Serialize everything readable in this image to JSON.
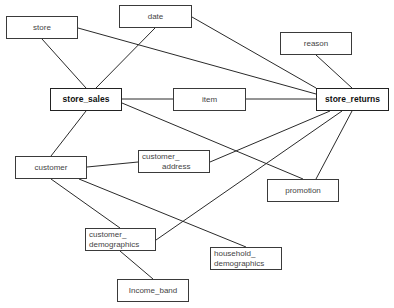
{
  "diagram": {
    "type": "entity-relationship",
    "nodes": [
      {
        "id": "store",
        "label": "store",
        "bold": false,
        "x": 6,
        "y": 16,
        "w": 72,
        "h": 23
      },
      {
        "id": "date",
        "label": "date",
        "bold": false,
        "x": 119,
        "y": 5,
        "w": 73,
        "h": 23
      },
      {
        "id": "reason",
        "label": "reason",
        "bold": false,
        "x": 280,
        "y": 32,
        "w": 72,
        "h": 23
      },
      {
        "id": "store_sales",
        "label": "store_sales",
        "bold": true,
        "x": 50,
        "y": 88,
        "w": 72,
        "h": 23
      },
      {
        "id": "item",
        "label": "item",
        "bold": false,
        "x": 173,
        "y": 88,
        "w": 73,
        "h": 23
      },
      {
        "id": "store_returns",
        "label": "store_returns",
        "bold": true,
        "x": 316,
        "y": 88,
        "w": 73,
        "h": 23
      },
      {
        "id": "customer",
        "label": "customer",
        "bold": false,
        "x": 15,
        "y": 156,
        "w": 72,
        "h": 23
      },
      {
        "id": "customer_address",
        "line1": "customer_",
        "line2": "address",
        "bold": false,
        "x": 138,
        "y": 150,
        "w": 72,
        "h": 23
      },
      {
        "id": "promotion",
        "label": "promotion",
        "bold": false,
        "x": 267,
        "y": 179,
        "w": 72,
        "h": 23
      },
      {
        "id": "customer_demographics",
        "line1": "customer_",
        "line2": "demographics",
        "bold": false,
        "x": 85,
        "y": 228,
        "w": 71,
        "h": 23
      },
      {
        "id": "household_demographics",
        "line1": "household_",
        "line2": "demographics",
        "bold": false,
        "x": 210,
        "y": 247,
        "w": 72,
        "h": 23
      },
      {
        "id": "income_band",
        "label": "Income_band",
        "bold": false,
        "x": 117,
        "y": 279,
        "w": 72,
        "h": 23
      }
    ],
    "edges": [
      {
        "from": "store",
        "to": "store_sales",
        "x1": 42,
        "y1": 39,
        "x2": 86,
        "y2": 88
      },
      {
        "from": "date",
        "to": "store_sales",
        "x1": 155,
        "y1": 28,
        "x2": 96,
        "y2": 88
      },
      {
        "from": "store",
        "to": "store_returns",
        "x1": 78,
        "y1": 28,
        "x2": 316,
        "y2": 94
      },
      {
        "from": "date",
        "to": "store_returns",
        "x1": 192,
        "y1": 17,
        "x2": 316,
        "y2": 88
      },
      {
        "from": "reason",
        "to": "store_returns",
        "x1": 316,
        "y1": 55,
        "x2": 352,
        "y2": 88
      },
      {
        "from": "store_sales",
        "to": "item",
        "x1": 122,
        "y1": 99,
        "x2": 173,
        "y2": 99
      },
      {
        "from": "item",
        "to": "store_returns",
        "x1": 246,
        "y1": 99,
        "x2": 316,
        "y2": 99
      },
      {
        "from": "store_sales",
        "to": "customer",
        "x1": 86,
        "y1": 111,
        "x2": 51,
        "y2": 156
      },
      {
        "from": "store_sales",
        "to": "promotion",
        "x1": 122,
        "y1": 103,
        "x2": 303,
        "y2": 179
      },
      {
        "from": "customer",
        "to": "customer_address",
        "x1": 87,
        "y1": 167,
        "x2": 138,
        "y2": 162
      },
      {
        "from": "customer_address",
        "to": "store_returns",
        "x1": 210,
        "y1": 162,
        "x2": 330,
        "y2": 111
      },
      {
        "from": "store_returns",
        "to": "promotion",
        "x1": 352,
        "y1": 111,
        "x2": 316,
        "y2": 179
      },
      {
        "from": "store_returns",
        "to": "customer_demographics",
        "x1": 342,
        "y1": 111,
        "x2": 156,
        "y2": 240
      },
      {
        "from": "customer",
        "to": "customer_demographics",
        "x1": 51,
        "y1": 179,
        "x2": 120,
        "y2": 228
      },
      {
        "from": "customer",
        "to": "household_demographics",
        "x1": 79,
        "y1": 179,
        "x2": 246,
        "y2": 247
      },
      {
        "from": "customer_demographics",
        "to": "income_band",
        "x1": 120,
        "y1": 251,
        "x2": 153,
        "y2": 279
      }
    ]
  }
}
